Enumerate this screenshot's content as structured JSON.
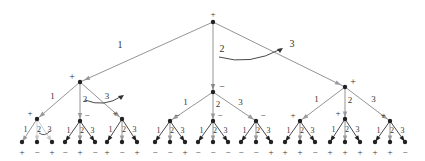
{
  "diagram": {
    "type": "game-tree",
    "branching_factor": 3,
    "edge_labels": [
      "1",
      "2",
      "3"
    ],
    "colors": {
      "edge_dark": "#333333",
      "edge_mid": "#888888",
      "edge_light": "#c8c8c8",
      "node": "#222222",
      "arrow_gray": "#999999",
      "text": "#333333"
    },
    "root": {
      "sign": "+",
      "x": 213,
      "y": 22
    },
    "level1": [
      {
        "sign": "+",
        "x": 80,
        "y": 82,
        "edge_label_x": 120,
        "edge_label_y": 48
      },
      {
        "sign": "−",
        "x": 213,
        "y": 92,
        "edge_label_x": 222,
        "edge_label_y": 52
      },
      {
        "sign": "+",
        "x": 345,
        "y": 87,
        "edge_label_x": 292,
        "edge_label_y": 47
      }
    ],
    "level2": [
      {
        "sign": "+",
        "x": 37,
        "y": 119
      },
      {
        "sign": "−",
        "x": 80,
        "y": 121
      },
      {
        "sign": "+",
        "x": 122,
        "y": 119
      },
      {
        "sign": "−",
        "x": 170,
        "y": 121
      },
      {
        "sign": "−",
        "x": 213,
        "y": 121
      },
      {
        "sign": "−",
        "x": 256,
        "y": 121
      },
      {
        "sign": "+",
        "x": 300,
        "y": 121
      },
      {
        "sign": "+",
        "x": 345,
        "y": 119
      },
      {
        "sign": "+",
        "x": 390,
        "y": 121
      }
    ],
    "leaves": [
      "+",
      "−",
      "+",
      "−",
      "+",
      "−",
      "+",
      "−",
      "+",
      "−",
      "−",
      "+",
      "−",
      "−",
      "−",
      "−",
      "−",
      "+",
      "+",
      "+",
      "−",
      "+",
      "+",
      "+",
      "+",
      "+",
      "−"
    ],
    "leaf_y": 147,
    "leaf_spread": 15,
    "annotations": {
      "root_arc_label": "3",
      "level1_left_arc_label": "3"
    }
  }
}
